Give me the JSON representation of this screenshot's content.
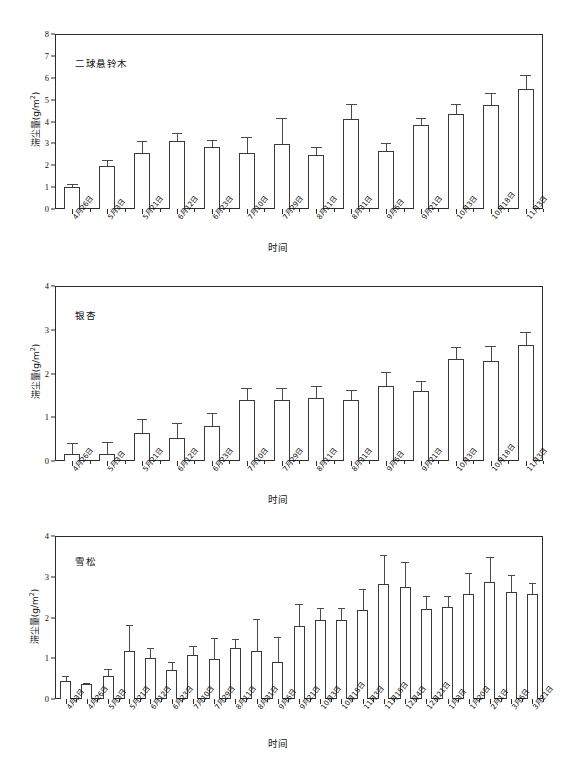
{
  "figure": {
    "background": "#ffffff",
    "axis_color": "#2b2b2b",
    "bar_fill": "#ffffff",
    "bar_stroke": "#3a3a3a"
  },
  "axis_titles": {
    "x": "时间",
    "y": "滞尘量(g/m",
    "y_sup": "2",
    "y_close": ")"
  },
  "chart_data": [
    {
      "type": "bar",
      "title": "二球悬铃木",
      "xlabel": "时间",
      "ylabel": "滞尘量(g/m²)",
      "ylim": [
        0,
        8
      ],
      "yticks": [
        0,
        1,
        2,
        3,
        4,
        5,
        6,
        7,
        8
      ],
      "grid": false,
      "legend": "none",
      "categories": [
        "4月26日",
        "5月3日",
        "5月21日",
        "6月12日",
        "6月23日",
        "7月10日",
        "7月29日",
        "8月11日",
        "8月31日",
        "9月6日",
        "9月21日",
        "10月3日",
        "10月18日",
        "11月3日"
      ],
      "values": [
        1.0,
        1.97,
        2.58,
        3.09,
        2.84,
        2.57,
        2.97,
        2.47,
        4.12,
        2.64,
        3.82,
        4.36,
        4.75,
        5.48
      ],
      "errors": [
        0.13,
        0.25,
        0.55,
        0.4,
        0.33,
        0.72,
        1.17,
        0.38,
        0.7,
        0.4,
        0.34,
        0.45,
        0.55,
        0.66
      ]
    },
    {
      "type": "bar",
      "title": "银杏",
      "xlabel": "时间",
      "ylabel": "滞尘量(g/m²)",
      "ylim": [
        0,
        4
      ],
      "yticks": [
        0,
        1,
        2,
        3,
        4
      ],
      "grid": false,
      "legend": "none",
      "categories": [
        "4月26日",
        "5月3日",
        "5月21日",
        "6月12日",
        "6月23日",
        "7月10日",
        "7月29日",
        "8月11日",
        "8月31日",
        "9月6日",
        "9月21日",
        "10月3日",
        "10月18日",
        "11月3日"
      ],
      "values": [
        0.15,
        0.15,
        0.65,
        0.52,
        0.81,
        1.4,
        1.4,
        1.43,
        1.4,
        1.71,
        1.6,
        2.34,
        2.28,
        2.65
      ],
      "errors": [
        0.26,
        0.28,
        0.3,
        0.35,
        0.28,
        0.28,
        0.27,
        0.28,
        0.22,
        0.33,
        0.22,
        0.27,
        0.35,
        0.31
      ]
    },
    {
      "type": "bar",
      "title": "雪松",
      "xlabel": "时间",
      "ylabel": "滞尘量(g/m²)",
      "ylim": [
        0,
        4
      ],
      "yticks": [
        0,
        1,
        2,
        3,
        4
      ],
      "grid": false,
      "legend": "none",
      "categories": [
        "4月3日",
        "4月26日",
        "5月3日",
        "5月21日",
        "6月12日",
        "6月23日",
        "7月10日",
        "7月29日",
        "8月11日",
        "8月31日",
        "9月6日",
        "9月21日",
        "10月3日",
        "10月18日",
        "11月3日",
        "11月18日",
        "12月4日",
        "12月21日",
        "1月3日",
        "1月20日",
        "2月1日",
        "3月6日",
        "3月21日"
      ],
      "values": [
        0.45,
        0.38,
        0.57,
        1.19,
        1.0,
        0.7,
        1.07,
        0.97,
        1.25,
        1.18,
        0.9,
        1.78,
        1.95,
        1.95,
        2.18,
        2.82,
        2.76,
        2.22,
        2.25,
        2.57,
        2.86,
        2.62,
        2.57
      ],
      "errors": [
        0.12,
        0.02,
        0.17,
        0.63,
        0.25,
        0.2,
        0.23,
        0.52,
        0.22,
        0.78,
        0.62,
        0.54,
        0.28,
        0.28,
        0.52,
        0.72,
        0.6,
        0.3,
        0.27,
        0.52,
        0.63,
        0.42,
        0.28
      ]
    }
  ]
}
